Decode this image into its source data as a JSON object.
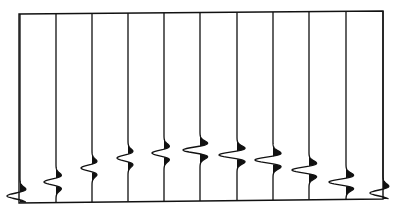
{
  "figure": {
    "ink_color": "#111111",
    "background_color": "#ffffff"
  },
  "chart_data": {
    "type": "line",
    "title": "",
    "xlabel": "",
    "ylabel": "",
    "grid": false,
    "frame": {
      "left": 19,
      "top_left": 14,
      "top_right": 11,
      "right": 383,
      "bottom_left": 203,
      "bottom_right": 199
    },
    "trace_count": 11,
    "traces": [
      {
        "index": 1,
        "x": 20,
        "event_y": 196,
        "amplitude": 13
      },
      {
        "index": 2,
        "x": 56,
        "event_y": 182,
        "amplitude": 12
      },
      {
        "index": 3,
        "x": 92,
        "event_y": 168,
        "amplitude": 11
      },
      {
        "index": 4,
        "x": 128,
        "event_y": 158,
        "amplitude": 11
      },
      {
        "index": 5,
        "x": 164,
        "event_y": 153,
        "amplitude": 12
      },
      {
        "index": 6,
        "x": 200,
        "event_y": 150,
        "amplitude": 17
      },
      {
        "index": 7,
        "x": 237,
        "event_y": 155,
        "amplitude": 18
      },
      {
        "index": 8,
        "x": 273,
        "event_y": 160,
        "amplitude": 18
      },
      {
        "index": 9,
        "x": 309,
        "event_y": 170,
        "amplitude": 17
      },
      {
        "index": 10,
        "x": 346,
        "event_y": 182,
        "amplitude": 17
      },
      {
        "index": 11,
        "x": 383,
        "event_y": 193,
        "amplitude": 13
      }
    ],
    "wavelet": "Ricker-like: central negative trough (leftward, unfilled) flanked by two positive lobes (rightward, filled black)"
  }
}
